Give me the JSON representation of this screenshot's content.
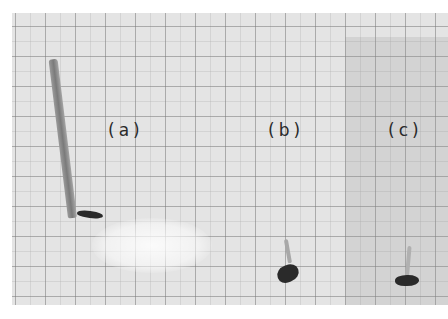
{
  "figure": {
    "panels": [
      {
        "id": "a",
        "label": "(a)",
        "seedling": "long shoot"
      },
      {
        "id": "b",
        "label": "(b)",
        "seedling": "short shoot"
      },
      {
        "id": "c",
        "label": "(c)",
        "seedling": "short shoot"
      }
    ]
  },
  "colors": {
    "paper": "#e4e4e4",
    "grid": "#787878",
    "shoot": "#8a8a8a",
    "seed": "#2a2a2a",
    "label": "#2a2a2a"
  }
}
